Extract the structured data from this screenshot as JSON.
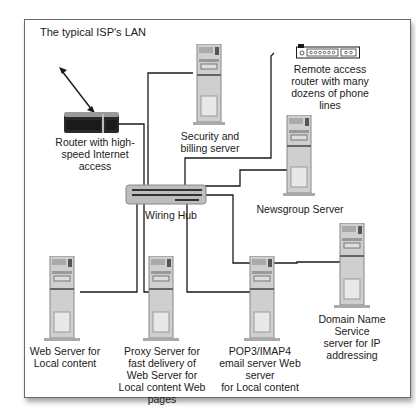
{
  "title": "The typical ISP's LAN",
  "nodes": {
    "router": {
      "label": "Router with high-speed Internet access",
      "lines": [
        "Router with high-",
        "speed Internet",
        "access"
      ]
    },
    "security": {
      "label": "Security and billing server",
      "lines": [
        "Security and",
        "billing server"
      ]
    },
    "remote": {
      "label": "Remote access router with many dozens of phone lines",
      "lines": [
        "Remote access",
        "router with many",
        "dozens of phone",
        "lines"
      ]
    },
    "hub": {
      "label": "Wiring Hub"
    },
    "newsgroup": {
      "label": "Newsgroup Server"
    },
    "webserver": {
      "label": "Web Server for Local content",
      "lines": [
        "Web Server for",
        "Local content"
      ]
    },
    "proxy": {
      "label": "Proxy Server for fast delivery of Web Server for Local content Web pages",
      "lines": [
        "Proxy Server for",
        "fast delivery of",
        "Web Server for",
        "Local content Web pages"
      ]
    },
    "pop3": {
      "label": "POP3/IMAP4 email server Web server for Local content",
      "lines": [
        "POP3/IMAP4",
        "email server Web server",
        "for Local content"
      ]
    },
    "dns": {
      "label": "Domain Name Service server for IP addressing",
      "lines": [
        "Domain Name Service",
        "server for IP",
        "addressing"
      ]
    }
  },
  "colors": {
    "line": "#1a1a1a",
    "frame": "#6a6a6a",
    "tower": "#c8c8c8",
    "hub": "#bdbdbd"
  }
}
